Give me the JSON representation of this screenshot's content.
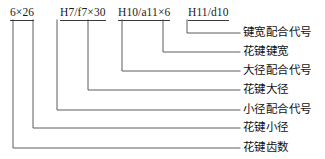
{
  "diagram": {
    "type": "spline-designation-callout",
    "codes": [
      {
        "text": "6×26",
        "x": 10,
        "y": 8,
        "underline": true
      },
      {
        "text": "H7/f7×30",
        "x": 60,
        "y": 8,
        "underline": true
      },
      {
        "text": "H10/a11×6",
        "x": 118,
        "y": 8,
        "underline": true
      },
      {
        "text": "H11/d10",
        "x": 188,
        "y": 8,
        "underline": true
      }
    ],
    "callouts": [
      {
        "label": "键宽配合代号",
        "stem_x": 187,
        "row_y": 33,
        "text_x": 243
      },
      {
        "label": "花键键宽",
        "stem_x": 163,
        "row_y": 52,
        "text_x": 243
      },
      {
        "label": "大径配合代号",
        "stem_x": 141,
        "row_y": 71,
        "text_x": 243
      },
      {
        "label": "大径配合代号",
        "stem_x": 122,
        "row_y": 71,
        "text_x": 243
      },
      {
        "label": "花键大径",
        "stem_x": 122,
        "row_y": 90,
        "text_x": 243
      },
      {
        "label": "小径配合代号",
        "stem_x": 88,
        "row_y": 110,
        "text_x": 243
      },
      {
        "label": "花键小径",
        "stem_x": 33,
        "row_y": 128,
        "text_x": 243
      },
      {
        "label": "花键齿数",
        "stem_x": 13,
        "row_y": 148,
        "text_x": 243
      }
    ],
    "labels": [
      "键宽配合代号",
      "花键键宽",
      "大径配合代号",
      "花键大径",
      "小径配合代号",
      "花键小径",
      "花键齿数"
    ],
    "line_color": "#4a4a4a",
    "text_color": "#111111"
  }
}
